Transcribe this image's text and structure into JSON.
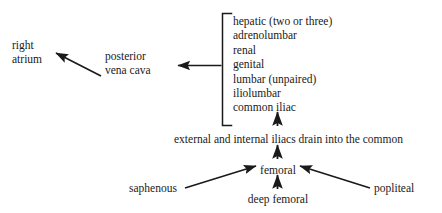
{
  "diagram": {
    "type": "flow-diagram",
    "background_color": "#ffffff",
    "ink_color": "#1a1a1a",
    "nodes": {
      "right_atrium": "right\natrium",
      "posterior_vena_cava": "posterior\nvena cava",
      "iliac_statement": "external and internal iliacs drain into the common",
      "femoral": "femoral",
      "deep_femoral": "deep femoral",
      "saphenous": "saphenous",
      "popliteal": "popliteal"
    },
    "tributaries": {
      "bracket_label": "tributaries of the posterior vena cava",
      "items": [
        "hepatic (two or three)",
        "adrenolumbar",
        "renal",
        "genital",
        "lumbar (unpaired)",
        "iliolumbar",
        "common iliac"
      ]
    },
    "edges": [
      {
        "name": "pvc-to-right-atrium",
        "from": "posterior vena cava",
        "to": "right atrium",
        "style": "diagonal-arrow"
      },
      {
        "name": "tributaries-to-pvc",
        "from": "tributary bracket",
        "to": "posterior vena cava",
        "style": "horizontal-arrow"
      },
      {
        "name": "iliac-statement-to-common-iliac",
        "from": "external and internal iliacs drain into the common",
        "to": "common iliac",
        "style": "vertical-arrow"
      },
      {
        "name": "femoral-to-iliac-statement",
        "from": "femoral",
        "to": "external and internal iliacs drain into the common",
        "style": "vertical-arrow"
      },
      {
        "name": "deep-femoral-to-femoral",
        "from": "deep femoral",
        "to": "femoral",
        "style": "vertical-arrow"
      },
      {
        "name": "saphenous-to-femoral",
        "from": "saphenous",
        "to": "femoral",
        "style": "diagonal-arrow"
      },
      {
        "name": "popliteal-to-femoral",
        "from": "popliteal",
        "to": "femoral",
        "style": "diagonal-arrow"
      }
    ]
  }
}
